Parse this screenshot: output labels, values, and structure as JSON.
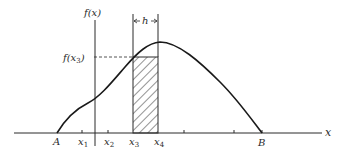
{
  "diagram": {
    "y_axis_label": "f(x)",
    "x_axis_label": "x",
    "point_labels": {
      "A": "A",
      "B": "B"
    },
    "tick_labels": [
      {
        "base": "x",
        "sub": "1"
      },
      {
        "base": "x",
        "sub": "2"
      },
      {
        "base": "x",
        "sub": "3"
      },
      {
        "base": "x",
        "sub": "4"
      }
    ],
    "value_label": {
      "base": "f(x",
      "sub": "3",
      "close": ")"
    },
    "width_label": "h",
    "colors": {
      "line": "#2a2a2a",
      "curve": "#1a1a1a",
      "background": "#ffffff"
    }
  }
}
